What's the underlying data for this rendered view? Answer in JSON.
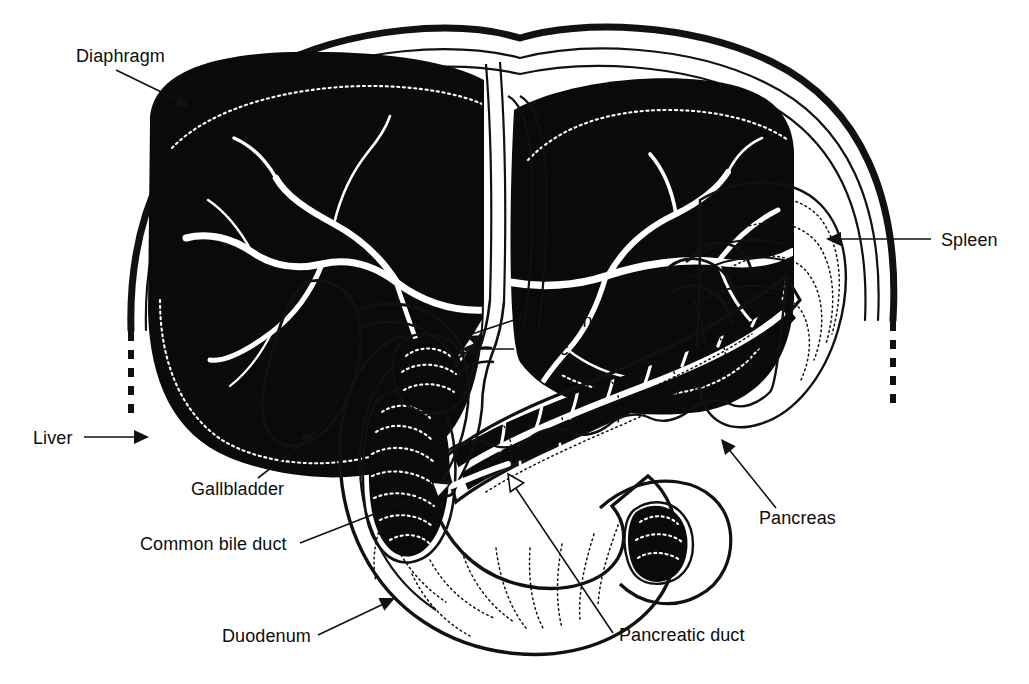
{
  "figure": {
    "style": "black-and-white line art, cut-away cross section",
    "background_color": "#ffffff",
    "ink_color": "#0d0d0d"
  },
  "labels": [
    {
      "id": "diaphragm",
      "text": "Diaphragm",
      "text_x": 76,
      "text_y": 62,
      "anchor": "start",
      "leader": "M 116 70 L 186 104",
      "arrow": "filled",
      "arrow_x": 190,
      "arrow_y": 107,
      "arrow_rot": 26
    },
    {
      "id": "spleen",
      "text": "Spleen",
      "text_x": 941,
      "text_y": 246,
      "anchor": "start",
      "leader": "M 931 239 L 830 239",
      "arrow": "filled",
      "arrow_x": 826,
      "arrow_y": 239,
      "arrow_rot": 180
    },
    {
      "id": "common-hepatic-duct",
      "text": "Common hepatic duct",
      "text_x": 519,
      "text_y": 327,
      "anchor": "start",
      "leader": "M 509 320 L 470 334",
      "arrow": "filled",
      "arrow_x": 466,
      "arrow_y": 336,
      "arrow_rot": 200
    },
    {
      "id": "cystic-duct",
      "text": "Cystic duct",
      "text_x": 519,
      "text_y": 355,
      "anchor": "start",
      "leader": "M 509 349 L 465 349",
      "arrow": "filled",
      "arrow_x": 461,
      "arrow_y": 349,
      "arrow_rot": 180
    },
    {
      "id": "liver",
      "text": "Liver",
      "text_x": 33,
      "text_y": 444,
      "anchor": "start",
      "leader": "M 84 437 L 142 437",
      "arrow": "filled",
      "arrow_x": 147,
      "arrow_y": 437,
      "arrow_rot": 0
    },
    {
      "id": "gallbladder",
      "text": "Gallbladder",
      "text_x": 191,
      "text_y": 495,
      "anchor": "start",
      "leader": "M 258 478 L 311 437",
      "arrow": "filled",
      "arrow_x": 315,
      "arrow_y": 433,
      "arrow_rot": -38
    },
    {
      "id": "common-bile-duct",
      "text": "Common bile duct",
      "text_x": 140,
      "text_y": 550,
      "anchor": "start",
      "leader": "M 300 543 L 444 487",
      "arrow": "open",
      "arrow_x": 448,
      "arrow_y": 485,
      "arrow_rot": -21
    },
    {
      "id": "duodenum",
      "text": "Duodenum",
      "text_x": 222,
      "text_y": 642,
      "anchor": "start",
      "leader": "M 318 635 L 390 601",
      "arrow": "filled",
      "arrow_x": 394,
      "arrow_y": 599,
      "arrow_rot": -25
    },
    {
      "id": "pancreatic-duct",
      "text": "Pancreatic duct",
      "text_x": 619,
      "text_y": 641,
      "anchor": "start",
      "leader": "M 613 633 L 510 479",
      "arrow": "open",
      "arrow_x": 507,
      "arrow_y": 475,
      "arrow_rot": -124
    },
    {
      "id": "pancreas",
      "text": "Pancreas",
      "text_x": 759,
      "text_y": 524,
      "anchor": "start",
      "leader": "M 776 508 L 724 444",
      "arrow": "filled",
      "arrow_x": 721,
      "arrow_y": 440,
      "arrow_rot": -129
    }
  ],
  "structures": [
    {
      "id": "diaphragm",
      "name": "Diaphragm",
      "rendering": "double arc outline with dashed tapering ends"
    },
    {
      "id": "liver",
      "name": "Liver",
      "rendering": "solid black lobes with white branching vessels and dotted inner margin"
    },
    {
      "id": "gallbladder",
      "name": "Gallbladder",
      "rendering": "white pear-shaped sac with dotted contour"
    },
    {
      "id": "common-hepatic-duct",
      "name": "Common hepatic duct",
      "rendering": "white tube outlined in black"
    },
    {
      "id": "cystic-duct",
      "name": "Cystic duct",
      "rendering": "white tube from gallbladder neck"
    },
    {
      "id": "common-bile-duct",
      "name": "Common bile duct",
      "rendering": "white duct descending to duodenal papilla"
    },
    {
      "id": "pancreas",
      "name": "Pancreas",
      "rendering": "lobulated outline with black cut-away interior"
    },
    {
      "id": "pancreatic-duct",
      "name": "Pancreatic duct",
      "rendering": "white duct with branching tributaries inside black pancreas"
    },
    {
      "id": "duodenum",
      "name": "Duodenum",
      "rendering": "C-shaped loop with dark lumen cut-aways and dotted plicae"
    },
    {
      "id": "spleen",
      "name": "Spleen",
      "rendering": "outlined organ with dotted texture at upper right"
    }
  ]
}
